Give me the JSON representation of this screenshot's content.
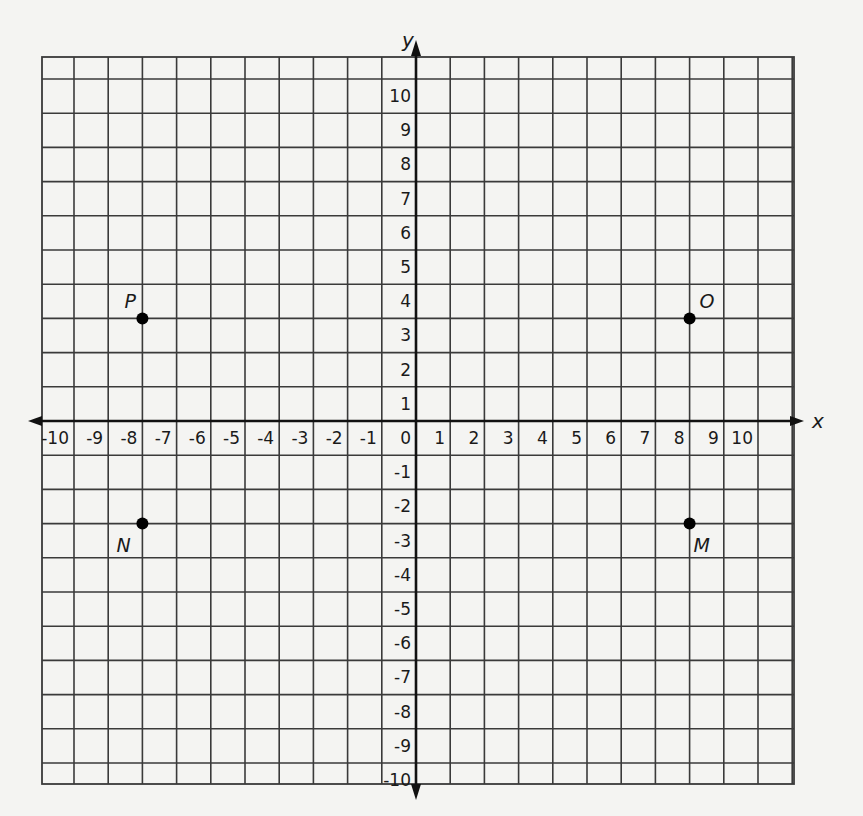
{
  "chart_data": {
    "type": "scatter",
    "title": "",
    "xlabel": "x",
    "ylabel": "y",
    "xlim": [
      -10,
      10
    ],
    "ylim": [
      -10,
      10
    ],
    "grid": true,
    "x_ticks": [
      "-10",
      "-9",
      "-8",
      "-7",
      "-6",
      "-5",
      "-4",
      "-3",
      "-2",
      "-1",
      "0",
      "1",
      "2",
      "3",
      "4",
      "5",
      "6",
      "7",
      "8",
      "9",
      "10"
    ],
    "y_ticks": [
      "10",
      "9",
      "8",
      "7",
      "6",
      "5",
      "4",
      "3",
      "2",
      "1",
      "-1",
      "-2",
      "-3",
      "-4",
      "-5",
      "-6",
      "-7",
      "-8",
      "-9",
      "-10"
    ],
    "points": [
      {
        "label": "P",
        "x": -8,
        "y": 3
      },
      {
        "label": "O",
        "x": 8,
        "y": 3
      },
      {
        "label": "N",
        "x": -8,
        "y": -3
      },
      {
        "label": "M",
        "x": 8,
        "y": -3
      }
    ]
  },
  "colors": {
    "background": "#f4f4f2",
    "grid": "#3a3a3a",
    "axis": "#111111",
    "point": "#000000"
  }
}
